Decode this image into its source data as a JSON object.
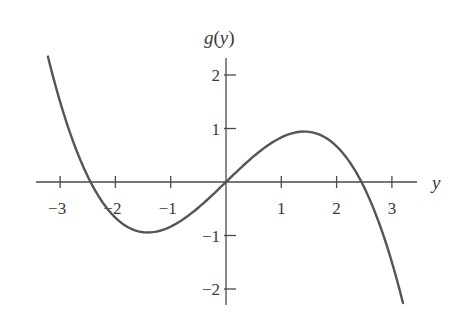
{
  "chart_data": {
    "type": "line",
    "title": "",
    "xlabel": "y",
    "ylabel": "g(y)",
    "ylabel_parts": {
      "fn": "g",
      "open": "(",
      "var": "y",
      "close": ")"
    },
    "function": "g(y) = y - y^3/6",
    "xlim": [
      -3.4,
      3.5
    ],
    "ylim": [
      -2.3,
      2.35
    ],
    "x_ticks": [
      -3,
      -2,
      -1,
      1,
      2,
      3
    ],
    "x_tick_labels": [
      "−3",
      "−2",
      "−1",
      "1",
      "2",
      "3"
    ],
    "y_ticks": [
      2,
      1,
      -1,
      -2
    ],
    "y_tick_labels": [
      "2",
      "1",
      "−1",
      "−2"
    ],
    "grid": false,
    "legend": null,
    "series": [
      {
        "name": "g(y)",
        "color": "#555555",
        "x": [
          -3.22,
          -3.0,
          -2.8,
          -2.6,
          -2.449,
          -2.2,
          -2.0,
          -1.8,
          -1.6,
          -1.414,
          -1.2,
          -1.0,
          -0.8,
          -0.6,
          -0.4,
          -0.2,
          0.0,
          0.2,
          0.4,
          0.6,
          0.8,
          1.0,
          1.2,
          1.414,
          1.6,
          1.8,
          2.0,
          2.2,
          2.449,
          2.6,
          2.8,
          3.0,
          3.2
        ],
        "values": [
          2.344,
          1.5,
          0.859,
          0.329,
          0.0,
          -0.425,
          -0.667,
          -0.828,
          -0.917,
          -0.943,
          -0.912,
          -0.833,
          -0.715,
          -0.564,
          -0.389,
          -0.199,
          0.0,
          0.199,
          0.389,
          0.564,
          0.715,
          0.833,
          0.912,
          0.943,
          0.917,
          0.828,
          0.667,
          0.425,
          0.0,
          -0.329,
          -0.859,
          -1.5,
          -2.261
        ]
      }
    ],
    "key_points": {
      "roots": [
        -2.449,
        0,
        2.449
      ],
      "local_max": [
        1.414,
        0.943
      ],
      "local_min": [
        -1.414,
        -0.943
      ]
    }
  },
  "colors": {
    "axis": "#4a4a4a",
    "curve": "#555555",
    "text": "#3a3a3a"
  }
}
